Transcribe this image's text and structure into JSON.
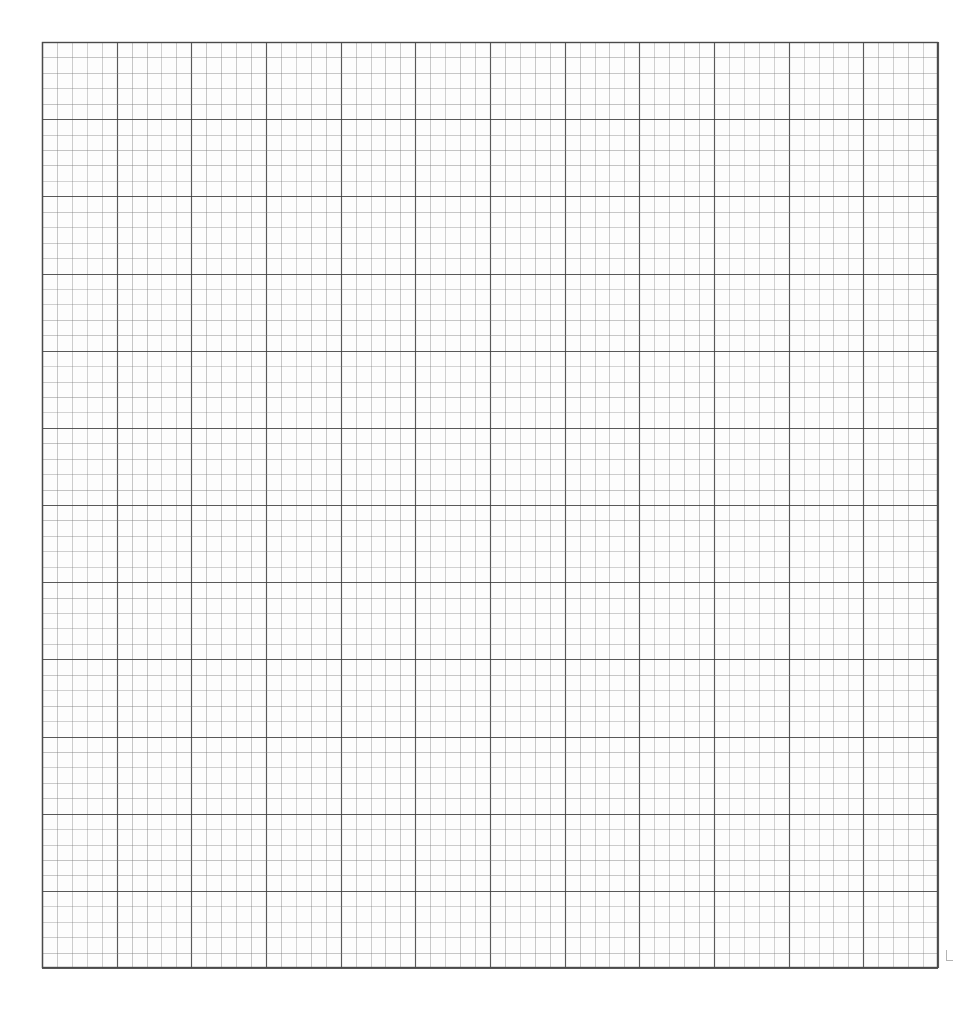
{
  "figure": {
    "title": "Gridded symbol field plot on graph paper",
    "kind": "scanned-scientific-figure",
    "background_color": "#ffffff",
    "ink_color": "#121212",
    "grid_minor_color": "#7a7a7a",
    "grid_major_color": "#3c3c3c",
    "paper_tint": "#fdfdfd"
  },
  "plot_area": {
    "left": 42,
    "top": 42,
    "right": 938,
    "bottom": 968,
    "width": 896,
    "height": 926,
    "cell_size_x": 14.93,
    "cell_size_y": 15.43,
    "columns": 60,
    "rows": 60,
    "major_every": 5,
    "border": true
  },
  "legend": {
    "symbol_classes": [
      {
        "id": 0,
        "name": "empty",
        "label": "no symbol",
        "description": "blank grid cell"
      },
      {
        "id": 1,
        "name": "bar",
        "label": "plain vertical bar",
        "description": "short straight vertical stroke"
      },
      {
        "id": 2,
        "name": "bar-long",
        "label": "long vertical bar",
        "description": "tall straight vertical stroke"
      },
      {
        "id": 3,
        "name": "scurve",
        "label": "S-curve",
        "description": "sigmoid wavy vertical stroke"
      },
      {
        "id": 4,
        "name": "barbed",
        "label": "barbed bar",
        "description": "vertical bar with horizontal cross ticks"
      },
      {
        "id": 5,
        "name": "beaded",
        "label": "beaded bar",
        "description": "vertical bar with dense round beads"
      }
    ]
  },
  "chart_data": {
    "type": "heatmap",
    "title": "Gridded symbol field plot on graph paper",
    "subtitle": "",
    "xlabel": "",
    "ylabel": "",
    "xlim": [
      0,
      60
    ],
    "ylim": [
      0,
      60
    ],
    "grid": true,
    "legend_position": "none",
    "encoding": "symbol complexity encodes field magnitude 0-5",
    "nx": 60,
    "ny": 60,
    "center": [
      30.0,
      30.0
    ],
    "field_model": {
      "description": "radial anisotropic lobed field with four diagonal arms and a rotating spiral bias",
      "core_radius": 6.5,
      "lobe_count": 4,
      "lobe_phase_deg": 45,
      "spiral_twist": 0.55,
      "arm_reach": 34,
      "noise_amplitude": 0.55,
      "thresholds": [
        0.16,
        0.32,
        0.48,
        0.66,
        0.82
      ]
    },
    "observed_features": [
      "dense beaded core spanning roughly columns 26-38 and rows 24-38",
      "barbed-bar annulus surrounding the core on the left and right flanks",
      "S-curve band forming diagonal arms to the upper-left, upper-right, lower-left and lower-right",
      "plain-bar fringe trailing out to the upper-right and lower-right corners",
      "isolated bar streaks along the bottom centre near rows 52-60",
      "isolated bar cluster at the far right near rows 30-42",
      "blank margins at the four corners of the sheet"
    ]
  },
  "annotations": {
    "corner_tick_visible": true,
    "corner_tick_position": [
      946,
      950
    ]
  }
}
